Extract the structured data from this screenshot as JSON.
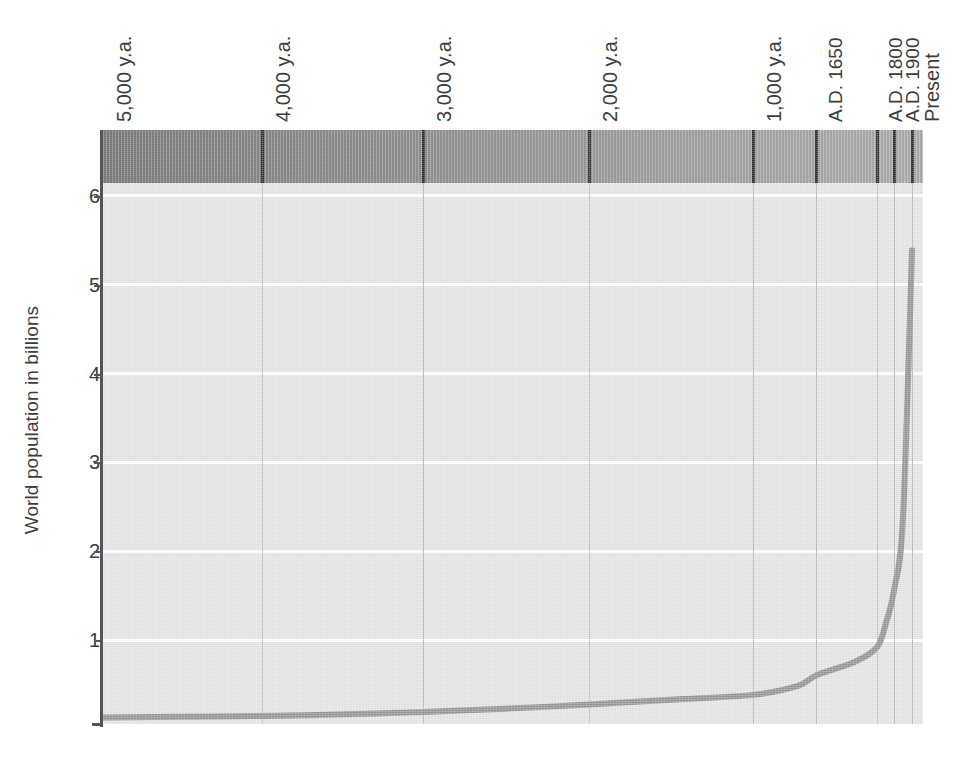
{
  "chart_data": {
    "type": "line",
    "title": "",
    "xlabel": "",
    "ylabel": "World population in billions",
    "ylim": [
      0,
      6.4
    ],
    "yticks": [
      1,
      2,
      3,
      4,
      5,
      6
    ],
    "ytick_labels": [
      "1",
      "2",
      "3",
      "4",
      "5",
      "6"
    ],
    "xtick_labels": [
      "5,000 y.a.",
      "4,000 y.a.",
      "3,000 y.a.",
      "2,000 y.a.",
      "1,000 y.a.",
      "A.D. 1650",
      "A.D. 1800",
      "A.D. 1900",
      "Present"
    ],
    "grid": "horizontal-and-vertical",
    "legend": "none",
    "x": [
      "5,000 y.a.",
      "4,500 y.a.",
      "4,000 y.a.",
      "3,500 y.a.",
      "3,000 y.a.",
      "2,500 y.a.",
      "2,000 y.a.",
      "1,500 y.a.",
      "1,000 y.a.",
      "A.D. 1500",
      "A.D. 1650",
      "A.D. 1750",
      "A.D. 1800",
      "A.D. 1850",
      "A.D. 1900",
      "A.D. 1950",
      "Present"
    ],
    "values": [
      0.03,
      0.04,
      0.05,
      0.07,
      0.1,
      0.14,
      0.19,
      0.25,
      0.31,
      0.42,
      0.55,
      0.72,
      0.9,
      1.2,
      1.6,
      2.5,
      5.8
    ],
    "series": [
      {
        "name": "World population",
        "values": [
          0.03,
          0.04,
          0.05,
          0.07,
          0.1,
          0.14,
          0.19,
          0.25,
          0.31,
          0.42,
          0.55,
          0.72,
          0.9,
          1.2,
          1.6,
          2.5,
          5.8
        ]
      }
    ],
    "annotations": [
      "Population is nearly flat from 5,000 years ago until about A.D. 1650",
      "Sharp exponential rise after A.D. 1800 reaching roughly 5.8 billion at present"
    ],
    "colors": {
      "curve": "#949494",
      "plot_background": "#e4e4e4",
      "gridline": "#ffffff",
      "vertical_gridline": "#b9b9b9",
      "era_band_left": "#6f6f6f",
      "era_band_right": "#ababab",
      "axis": "#555555",
      "text": "#3c3c3c"
    }
  },
  "axes": {
    "y_title": "World population in billions",
    "y_ticks": [
      {
        "label": "6",
        "value": 6
      },
      {
        "label": "5",
        "value": 5
      },
      {
        "label": "4",
        "value": 4
      },
      {
        "label": "3",
        "value": 3
      },
      {
        "label": "2",
        "value": 2
      },
      {
        "label": "1",
        "value": 1
      }
    ],
    "x_ticks": [
      {
        "label": "5,000 y.a.",
        "px": 0
      },
      {
        "label": "4,000 y.a.",
        "px": 159
      },
      {
        "label": "3,000 y.a.",
        "px": 320
      },
      {
        "label": "2,000 y.a.",
        "px": 486
      },
      {
        "label": "1,000 y.a.",
        "px": 650
      },
      {
        "label": "A.D. 1650",
        "px": 713
      },
      {
        "label": "A.D. 1800",
        "px": 774
      },
      {
        "label": "A.D. 1900",
        "px": 791
      },
      {
        "label": "Present",
        "px": 809
      }
    ]
  }
}
